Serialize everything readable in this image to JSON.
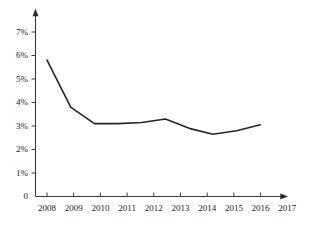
{
  "chart_data": {
    "type": "line",
    "title": "",
    "subtitle": "",
    "xlabel": "",
    "ylabel": "",
    "categories": [
      "2008",
      "2009",
      "2010",
      "2011",
      "2012",
      "2013",
      "2014",
      "2015",
      "2016",
      "2017"
    ],
    "x": [
      2008,
      2009,
      2010,
      2011,
      2012,
      2013,
      2014,
      2015,
      2016,
      2017
    ],
    "values": [
      5.8,
      3.8,
      3.1,
      3.1,
      3.15,
      3.3,
      2.9,
      2.65,
      2.8,
      3.05
    ],
    "series": [
      {
        "name": "",
        "values": [
          5.8,
          3.8,
          3.1,
          3.1,
          3.15,
          3.3,
          2.9,
          2.65,
          2.8,
          3.05
        ]
      }
    ],
    "ylim": [
      0,
      7.5
    ],
    "xlim": [
      2008,
      2017
    ],
    "y_ticks": [
      0,
      1,
      2,
      3,
      4,
      5,
      6,
      7
    ],
    "y_tick_labels": [
      "0",
      "1%",
      "2%",
      "3%",
      "4%",
      "5%",
      "6%",
      "7%"
    ],
    "x_tick_labels": [
      "2008",
      "2009",
      "2010",
      "2011",
      "2012",
      "2013",
      "2014",
      "2015",
      "2016",
      "2017"
    ],
    "grid": false,
    "legend": false,
    "legend_position": "none",
    "line_color": "#242424",
    "axis_color": "#3a3a3a",
    "background_color": "#ffffff",
    "markers": false,
    "annotations": []
  },
  "axes": {
    "y_labels": [
      {
        "text": "7%",
        "value": 7
      },
      {
        "text": "6%",
        "value": 6
      },
      {
        "text": "5%",
        "value": 5
      },
      {
        "text": "4%",
        "value": 4
      },
      {
        "text": "3%",
        "value": 3
      },
      {
        "text": "2%",
        "value": 2
      },
      {
        "text": "1%",
        "value": 1
      },
      {
        "text": "0",
        "value": 0
      }
    ],
    "x_labels": [
      {
        "text": "2008"
      },
      {
        "text": "2009"
      },
      {
        "text": "2010"
      },
      {
        "text": "2011"
      },
      {
        "text": "2012"
      },
      {
        "text": "2013"
      },
      {
        "text": "2014"
      },
      {
        "text": "2015"
      },
      {
        "text": "2016"
      },
      {
        "text": "2017"
      }
    ]
  }
}
